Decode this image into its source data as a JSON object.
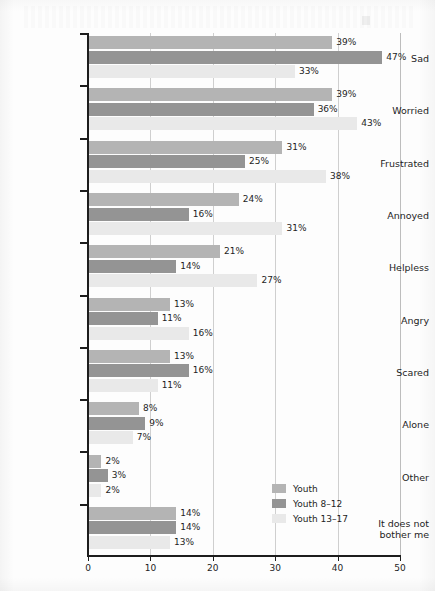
{
  "chart_data": {
    "type": "bar",
    "orientation": "horizontal",
    "title": "",
    "xlabel": "",
    "ylabel": "",
    "xlim": [
      0,
      50
    ],
    "xticks": [
      "0",
      "10",
      "20",
      "30",
      "40",
      "50"
    ],
    "grid": true,
    "legend_position": "bottom-right",
    "categories": [
      "Sad",
      "Worried",
      "Frustrated",
      "Annoyed",
      "Helpless",
      "Angry",
      "Scared",
      "Alone",
      "Other",
      "It does not\nbother me"
    ],
    "series": [
      {
        "name": "Youth",
        "color": "#b4b4b4",
        "values": [
          39,
          39,
          31,
          24,
          21,
          13,
          13,
          8,
          2,
          14
        ],
        "labels": [
          "39%",
          "39%",
          "31%",
          "24%",
          "21%",
          "13%",
          "13%",
          "8%",
          "2%",
          "14%"
        ]
      },
      {
        "name": "Youth 8–12",
        "color": "#949494",
        "values": [
          47,
          36,
          25,
          16,
          14,
          11,
          16,
          9,
          3,
          14
        ],
        "labels": [
          "47%",
          "36%",
          "25%",
          "16%",
          "14%",
          "11%",
          "16%",
          "9%",
          "3%",
          "14%"
        ]
      },
      {
        "name": "Youth 13–17",
        "color": "#e9e9e9",
        "values": [
          33,
          43,
          38,
          31,
          27,
          16,
          11,
          7,
          2,
          13
        ],
        "labels": [
          "33%",
          "43%",
          "38%",
          "31%",
          "27%",
          "16%",
          "11%",
          "7%",
          "2%",
          "13%"
        ]
      }
    ]
  },
  "legend": {
    "items": [
      {
        "label": "Youth",
        "color": "#b4b4b4"
      },
      {
        "label": "Youth 8–12",
        "color": "#949494"
      },
      {
        "label": "Youth 13–17",
        "color": "#e9e9e9"
      }
    ]
  },
  "axis": {
    "x_tick_labels": [
      "0",
      "10",
      "20",
      "30",
      "40",
      "50"
    ]
  }
}
